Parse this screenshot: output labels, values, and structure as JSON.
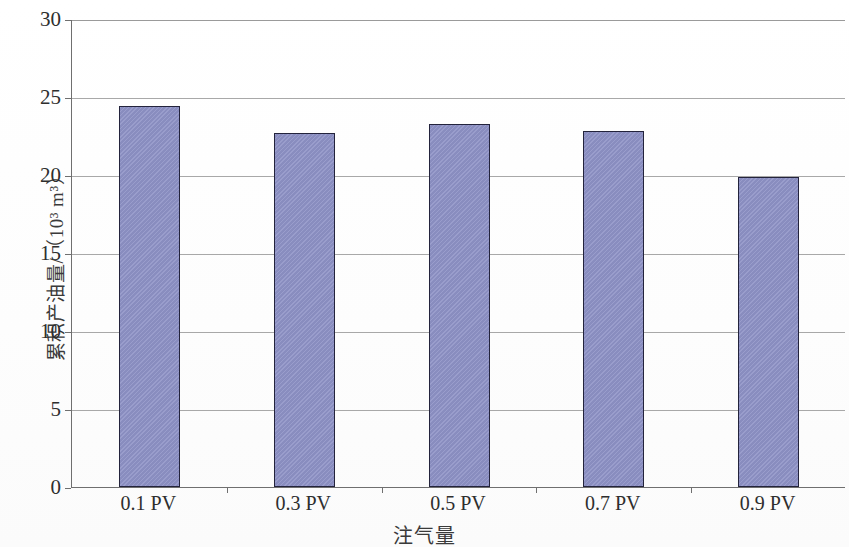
{
  "chart_data": {
    "type": "bar",
    "title": "",
    "subtitle": "",
    "categories": [
      "0.1 PV",
      "0.3 PV",
      "0.5 PV",
      "0.7 PV",
      "0.9 PV"
    ],
    "values": [
      24.4,
      22.7,
      23.3,
      22.8,
      19.9
    ],
    "series": [
      {
        "name": "累积产油量",
        "values": [
          24.4,
          22.7,
          23.3,
          22.8,
          19.9
        ]
      }
    ],
    "xlabel": "注气量",
    "ylabel": "累积产油量/（10³ m³）",
    "ylim": [
      0,
      30
    ],
    "y_ticks": [
      0,
      5,
      10,
      15,
      20,
      25,
      30
    ],
    "y_tick_labels": [
      "0",
      "5",
      "10",
      "15",
      "20",
      "25",
      "30"
    ],
    "grid": true,
    "grid_axis": "y",
    "legend": false,
    "legend_position": "none",
    "bar_fill_color": "#8e92c6",
    "bar_border_color": "#23233c",
    "gridline_color": "#a8a8a8",
    "axis_color": "#6f6f6f",
    "background_color": "#ffffff"
  },
  "axes": {
    "y_title": "累积产油量/（10³ m³）",
    "x_title": "注气量"
  }
}
